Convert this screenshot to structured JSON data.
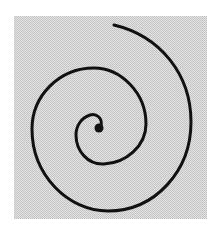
{
  "figure": {
    "colors": {
      "page_background": "#ffffff",
      "panel_light": "#e2e2e2",
      "panel_dark": "#c4c4c4",
      "stroke": "#111111"
    },
    "panel": {
      "x": 14,
      "y": 16,
      "width": 193,
      "height": 203
    },
    "spiral": {
      "center": [
        99,
        128
      ],
      "center_dot_radius": 4.5,
      "stroke_width": 3,
      "end_point": [
        114,
        25
      ]
    }
  }
}
